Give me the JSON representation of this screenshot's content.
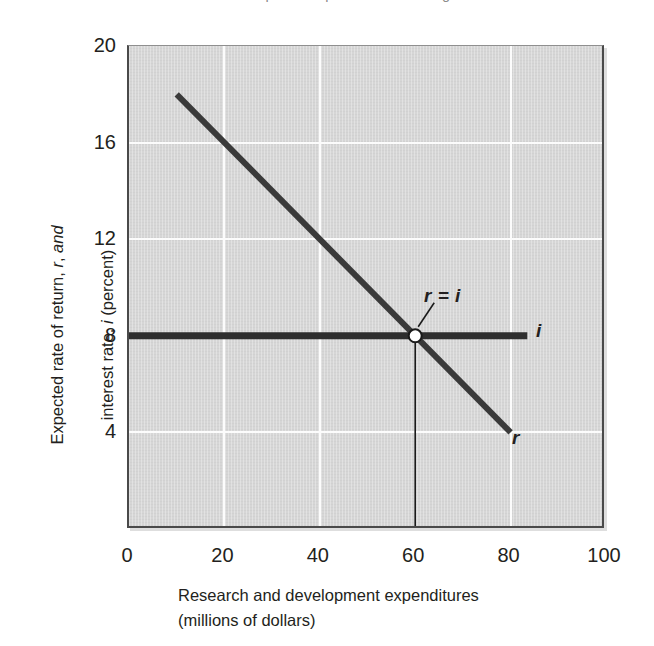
{
  "caption_remnant": "of research and development expenditures on marginal benefit and marginal cost",
  "chart_data": {
    "type": "line",
    "title": "",
    "xlabel": "Research and development expenditures (millions of dollars)",
    "xlabel_line1": "Research and development expenditures",
    "xlabel_line2": "(millions of dollars)",
    "ylabel": "Expected rate of return, r, and interest rate, i (percent)",
    "ylabel_line1": "Expected rate of return, r, and",
    "ylabel_line2": "interest rate, i (percent)",
    "xlim": [
      0,
      100
    ],
    "ylim": [
      0,
      20
    ],
    "xticks": [
      0,
      20,
      40,
      60,
      80,
      100
    ],
    "yticks": [
      4,
      8,
      12,
      16,
      20
    ],
    "grid": true,
    "gridlines": {
      "horizontal": [
        4,
        12,
        16
      ],
      "vertical": [
        20,
        40,
        80
      ]
    },
    "legend": "none",
    "series": [
      {
        "name": "r",
        "label": "r",
        "description": "Expected rate of return schedule (downward sloping)",
        "x": [
          10,
          80
        ],
        "values": [
          18,
          4
        ],
        "color": "#3a3a3a",
        "width": 6
      },
      {
        "name": "i",
        "label": "i",
        "description": "Interest rate (horizontal at 8 percent)",
        "x": [
          0,
          83.5
        ],
        "values": [
          8,
          8
        ],
        "color": "#2e2e2e",
        "width": 7
      }
    ],
    "annotations": [
      {
        "name": "equilibrium-point",
        "label": "r = i",
        "x": 60,
        "y": 8,
        "marker": "open-circle",
        "marker_fill": "#ffffff",
        "marker_stroke": "#1a1a1a"
      },
      {
        "name": "equilibrium-dropline",
        "label": "",
        "x": 60,
        "y_from": 8,
        "y_to": 0
      }
    ],
    "colors": {
      "plot_background": "#d6d6d6",
      "gridline": "#fcfcfc",
      "axis": "#4a4a4a",
      "curve": "#3a3a3a",
      "text": "#231f20",
      "page_background": "#ffffff"
    }
  }
}
